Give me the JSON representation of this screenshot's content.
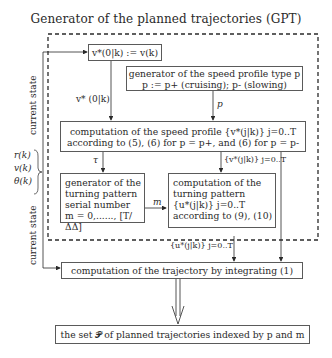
{
  "title": "Generator of the planned trajectories (GPT)",
  "boxes": {
    "init_speed": "v*(0|k) := v(k)",
    "speed_profile_type": {
      "line1": "generator of the speed profile type p",
      "line2": "p := p+ (cruising); p- (slowing)"
    },
    "speed_profile_computation": {
      "line1": "computation of the speed profile {v*(j|k)} j=0..T",
      "line2": "according to (5), (6) for p = p+, and (6) for p = p-"
    },
    "turning_serial": {
      "line1": "generator of the",
      "line2": "turning pattern",
      "line3": "serial number",
      "line4": "m = 0,......, [T/ΔΔ]"
    },
    "turning_computation": {
      "line1": "computation of the",
      "line2": "turning pattern",
      "line3": "{u*(j|k)} j=0..T",
      "line4": "according to (9), (10)"
    },
    "trajectory": "computation of the trajectory by integrating (1)",
    "output_set": "the set 𝓟 of planned trajectories indexed by p and m"
  },
  "labels": {
    "current_state_top": "current state",
    "current_state_bottom": "current state",
    "v0k": "v* (0|k)",
    "p": "p",
    "tau": "τ",
    "m": "m",
    "speed_profile_set": "{v*(j|k)} j=0..T",
    "turning_set": "{u*(j|k)} j=0..T",
    "inputs": [
      "r(k)",
      "v(k)",
      "θ(k)"
    ]
  }
}
